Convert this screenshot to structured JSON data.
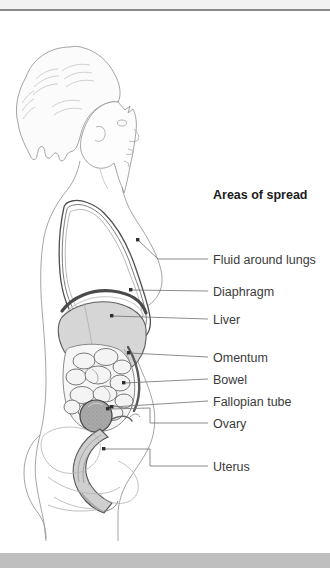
{
  "figure": {
    "title": "Areas of spread",
    "title_y": 184
  },
  "labels": [
    {
      "id": "fluid-around-lungs",
      "text": "Fluid around lungs",
      "y": 259,
      "leader": {
        "x1": 186,
        "y1": 259,
        "x2": 208,
        "y2": 259
      },
      "anchor": {
        "x": 138,
        "y": 240
      },
      "elbow": [
        [
          186,
          259
        ],
        [
          158,
          259
        ],
        [
          138,
          240
        ]
      ]
    },
    {
      "id": "diaphragm",
      "text": "Diaphragm",
      "y": 291,
      "leader": {
        "x1": 186,
        "y1": 291,
        "x2": 208,
        "y2": 291
      },
      "anchor": {
        "x": 131,
        "y": 290
      },
      "elbow": [
        [
          186,
          291
        ],
        [
          131,
          290
        ]
      ]
    },
    {
      "id": "liver",
      "text": "Liver",
      "y": 319,
      "leader": {
        "x1": 186,
        "y1": 319,
        "x2": 208,
        "y2": 319
      },
      "anchor": {
        "x": 110,
        "y": 313
      },
      "elbow": [
        [
          186,
          319
        ],
        [
          110,
          313
        ]
      ]
    },
    {
      "id": "omentum",
      "text": "Omentum",
      "y": 357,
      "leader": {
        "x1": 186,
        "y1": 357,
        "x2": 208,
        "y2": 357
      },
      "anchor": {
        "x": 128,
        "y": 351
      },
      "elbow": [
        [
          186,
          357
        ],
        [
          128,
          351
        ]
      ]
    },
    {
      "id": "bowel",
      "text": "Bowel",
      "y": 379,
      "leader": {
        "x1": 186,
        "y1": 379,
        "x2": 208,
        "y2": 379
      },
      "anchor": {
        "x": 124,
        "y": 381
      },
      "elbow": [
        [
          186,
          379
        ],
        [
          124,
          381
        ]
      ]
    },
    {
      "id": "fallopian-tube",
      "text": "Fallopian tube",
      "y": 401,
      "leader": {
        "x1": 186,
        "y1": 401,
        "x2": 208,
        "y2": 401
      },
      "anchor": {
        "x": 107,
        "y": 404
      },
      "elbow": [
        [
          186,
          401
        ],
        [
          107,
          404
        ]
      ]
    },
    {
      "id": "ovary",
      "text": "Ovary",
      "y": 423,
      "leader": {
        "x1": 186,
        "y1": 423,
        "x2": 208,
        "y2": 423
      },
      "anchor": {
        "x": 96,
        "y": 412
      },
      "elbow": [
        [
          186,
          423
        ],
        [
          148,
          423
        ],
        [
          148,
          405
        ],
        [
          96,
          412
        ]
      ]
    },
    {
      "id": "uterus",
      "text": "Uterus",
      "y": 466,
      "leader": {
        "x1": 186,
        "y1": 466,
        "x2": 208,
        "y2": 466
      },
      "anchor": {
        "x": 95,
        "y": 429
      },
      "elbow": [
        [
          186,
          466
        ],
        [
          148,
          466
        ],
        [
          148,
          429
        ],
        [
          95,
          429
        ]
      ]
    }
  ],
  "colors": {
    "top_bar": "#f2f2f2",
    "top_bar_border": "#8a8a8a",
    "bottom_bar": "#bfbfbf",
    "outline": "#9a9a9a",
    "organ_line": "#5e5e5e",
    "liver_fill": "#d8d8d8",
    "ovary_fill": "#a8a8a8",
    "uterus_fill": "#cfcfcf",
    "bowel_fill": "#f3f3f3",
    "label_text": "#3b3b3b",
    "title_text": "#1c1c1c",
    "leader_line": "#6f6f6f",
    "body_fill": "#fdfdfd"
  }
}
